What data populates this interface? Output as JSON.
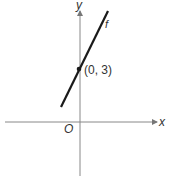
{
  "diagram": {
    "axes": {
      "x_label": "x",
      "y_label": "y",
      "origin_label": "O"
    },
    "line": {
      "label": "f",
      "point_label": "(0, 3)"
    },
    "colors": {
      "axis": "#888888",
      "line": "#1a1a1a",
      "text": "#333333"
    }
  }
}
